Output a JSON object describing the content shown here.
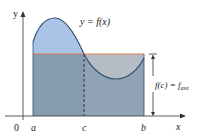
{
  "figure": {
    "curve_label": "y = f(x)",
    "y_axis_label": "y",
    "x_axis_label": "x",
    "origin_label": "0",
    "tick_labels": {
      "a": "a",
      "c": "c",
      "b": "b"
    },
    "average_label": "f(c) = f",
    "average_subscript": "ave",
    "colors": {
      "area_under_curve": "#a9c4e6",
      "rectangle": "#8fa3b5",
      "excess_region": "#b6bcc4",
      "average_line": "#e07a4f",
      "curve": "#2f5073",
      "axes": "#333333"
    }
  }
}
